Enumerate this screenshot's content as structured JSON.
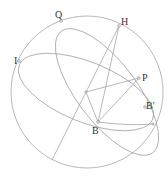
{
  "diagram": {
    "type": "celestial-sphere-geometry",
    "labels": {
      "Q": "Q",
      "H": "H",
      "I": "I",
      "P": "P",
      "Bprime": "B'",
      "B": "B"
    },
    "colors": {
      "stroke": "#9a9a9a",
      "text": "#333333",
      "background": "#ffffff"
    }
  }
}
